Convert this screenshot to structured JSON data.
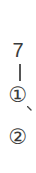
{
  "vertical_text": {
    "number": "7",
    "dash": "|",
    "item1": "①",
    "comma": "、",
    "item2": "②"
  }
}
